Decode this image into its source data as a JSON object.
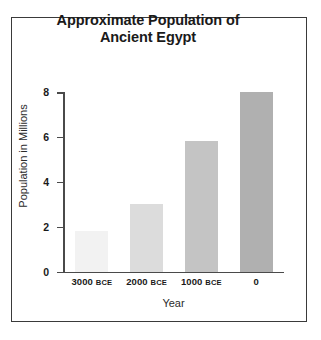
{
  "chart_data": {
    "type": "bar",
    "title": "Approximate Population of Ancient Egypt",
    "title_lines": [
      "Approximate Population of",
      "Ancient Egypt"
    ],
    "categories": [
      "3000 BCE",
      "2000 BCE",
      "1000 BCE",
      "0"
    ],
    "category_parts": [
      {
        "number": "3000",
        "era": "BCE"
      },
      {
        "number": "2000",
        "era": "BCE"
      },
      {
        "number": "1000",
        "era": "BCE"
      },
      {
        "number": "0",
        "era": ""
      }
    ],
    "values": [
      1.8,
      3.0,
      5.8,
      8.0
    ],
    "xlabel": "Year",
    "ylabel": "Population in Millions",
    "ylim": [
      0,
      8
    ],
    "yticks": [
      0,
      2,
      4,
      6,
      8
    ],
    "ytick_labels": [
      "0",
      "2",
      "4",
      "6",
      "8"
    ],
    "grid": false,
    "legend": false,
    "bar_colors": [
      "#f2f2f2",
      "#dcdcdc",
      "#c4c4c4",
      "#b0b0b0"
    ],
    "axis_color": "#4a4a4a",
    "text_color": "#1a1a1a",
    "background": "#ffffff",
    "border_color": "#3a3a3a"
  }
}
